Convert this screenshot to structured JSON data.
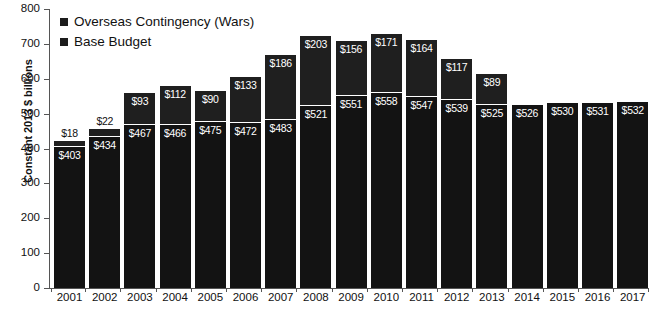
{
  "chart_data": {
    "type": "bar",
    "title": "",
    "xlabel": "",
    "ylabel": "Constant 2013 $ billions",
    "ylim": [
      0,
      800
    ],
    "ytick_labels": [
      "0",
      "100",
      "200",
      "300",
      "400",
      "500",
      "600",
      "700",
      "800"
    ],
    "ytick_values": [
      0,
      100,
      200,
      300,
      400,
      500,
      600,
      700,
      800
    ],
    "grid": false,
    "stacked": true,
    "legend_position": "top-left",
    "categories": [
      "2001",
      "2002",
      "2003",
      "2004",
      "2005",
      "2006",
      "2007",
      "2008",
      "2009",
      "2010",
      "2011",
      "2012",
      "2013",
      "2014",
      "2015",
      "2016",
      "2017"
    ],
    "series": [
      {
        "name": "Overseas Contingency (Wars)",
        "color": "#1f1f1f",
        "values": [
          18,
          22,
          93,
          112,
          90,
          133,
          186,
          203,
          156,
          171,
          164,
          117,
          89,
          0,
          0,
          0,
          0
        ],
        "labels": [
          "$18",
          "$22",
          "$93",
          "$112",
          "$90",
          "$133",
          "$186",
          "$203",
          "$156",
          "$171",
          "$164",
          "$117",
          "$89",
          "",
          "",
          "",
          ""
        ]
      },
      {
        "name": "Base Budget",
        "color": "#131313",
        "values": [
          403,
          434,
          467,
          466,
          475,
          472,
          483,
          521,
          551,
          558,
          547,
          539,
          525,
          526,
          530,
          531,
          532
        ],
        "labels": [
          "$403",
          "$434",
          "$467",
          "$466",
          "$475",
          "$472",
          "$483",
          "$521",
          "$551",
          "$558",
          "$547",
          "$539",
          "$525",
          "$526",
          "$530",
          "$531",
          "$532"
        ]
      }
    ],
    "totals": [
      421,
      456,
      560,
      578,
      565,
      605,
      669,
      724,
      707,
      729,
      711,
      656,
      614,
      526,
      530,
      531,
      532
    ]
  },
  "legend": {
    "items": [
      {
        "label": "Overseas Contingency (Wars)"
      },
      {
        "label": "Base Budget"
      }
    ]
  },
  "axes": {
    "y_title": "Constant 2013 $ billions"
  }
}
